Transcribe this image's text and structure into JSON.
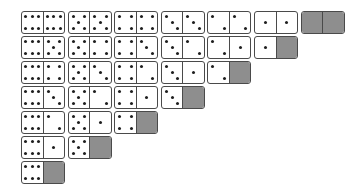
{
  "colors": {
    "face": "#ffffff",
    "border": "#4a4a4a",
    "pip": "#1e1e1e",
    "blank_half": "#8e8e8e"
  },
  "layout": {
    "origin_x": 21,
    "origin_y": 11,
    "pitch_x": 46.6,
    "pitch_y": 25,
    "domino_width": 44,
    "domino_height": 23
  },
  "rows": [
    {
      "dominoes": [
        [
          6,
          6
        ],
        [
          5,
          5
        ],
        [
          4,
          4
        ],
        [
          3,
          3
        ],
        [
          2,
          2
        ],
        [
          1,
          1
        ],
        [
          0,
          0
        ]
      ]
    },
    {
      "dominoes": [
        [
          6,
          5
        ],
        [
          5,
          4
        ],
        [
          4,
          3
        ],
        [
          3,
          2
        ],
        [
          2,
          1
        ],
        [
          1,
          0
        ]
      ]
    },
    {
      "dominoes": [
        [
          6,
          4
        ],
        [
          5,
          3
        ],
        [
          4,
          2
        ],
        [
          3,
          1
        ],
        [
          2,
          0
        ]
      ]
    },
    {
      "dominoes": [
        [
          6,
          3
        ],
        [
          5,
          2
        ],
        [
          4,
          1
        ],
        [
          3,
          0
        ]
      ]
    },
    {
      "dominoes": [
        [
          6,
          2
        ],
        [
          5,
          1
        ],
        [
          4,
          0
        ]
      ]
    },
    {
      "dominoes": [
        [
          6,
          1
        ],
        [
          5,
          0
        ]
      ]
    },
    {
      "dominoes": [
        [
          6,
          0
        ]
      ]
    }
  ]
}
